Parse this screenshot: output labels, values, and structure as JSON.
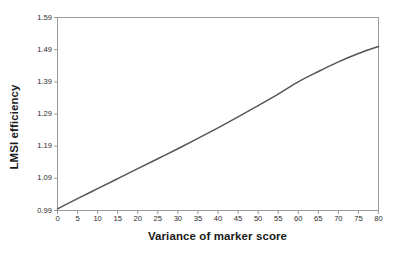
{
  "chart_data": {
    "type": "line",
    "title": "",
    "xlabel": "Variance of marker score",
    "ylabel": "LMSI efficiency",
    "xlim": [
      0,
      80
    ],
    "ylim": [
      0.99,
      1.59
    ],
    "xticks": [
      0,
      5,
      10,
      15,
      20,
      25,
      30,
      35,
      40,
      45,
      50,
      55,
      60,
      65,
      70,
      75,
      80
    ],
    "xtick_labels": [
      "0",
      "5",
      "10",
      "15",
      "20",
      "25",
      "30",
      "35",
      "40",
      "45",
      "50",
      "55",
      "60",
      "65",
      "70",
      "75",
      "80"
    ],
    "yticks": [
      0.99,
      1.09,
      1.19,
      1.29,
      1.39,
      1.49,
      1.59
    ],
    "ytick_labels": [
      "0.99",
      "1.09",
      "1.19",
      "1.29",
      "1.39",
      "1.49",
      "1.59"
    ],
    "grid": false,
    "legend": null,
    "line_color": "#555555",
    "frame_color": "#9a9a9a",
    "background": "#ffffff",
    "series": [
      {
        "name": "LMSI efficiency",
        "x": [
          0,
          5,
          10,
          15,
          20,
          25,
          30,
          35,
          40,
          45,
          50,
          55,
          60,
          65,
          70,
          75,
          80
        ],
        "values": [
          0.995,
          1.027,
          1.058,
          1.089,
          1.12,
          1.151,
          1.182,
          1.214,
          1.247,
          1.281,
          1.316,
          1.352,
          1.39,
          1.422,
          1.452,
          1.478,
          1.5
        ]
      }
    ]
  }
}
